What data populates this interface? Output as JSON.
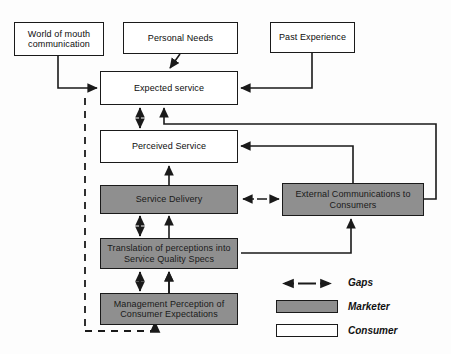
{
  "diagram": {
    "colors": {
      "marketer_fill": "#8f8f8f",
      "consumer_fill": "#ffffff",
      "stroke": "#1a1a1a",
      "background": "#fdfdfd"
    },
    "nodes": [
      {
        "id": "word_of_mouth",
        "label": "World of mouth communication",
        "type": "consumer"
      },
      {
        "id": "personal_needs",
        "label": "Personal Needs",
        "type": "consumer"
      },
      {
        "id": "past_experience",
        "label": "Past Experience",
        "type": "consumer"
      },
      {
        "id": "expected_service",
        "label": "Expected service",
        "type": "consumer"
      },
      {
        "id": "perceived_service",
        "label": "Perceived Service",
        "type": "consumer"
      },
      {
        "id": "service_delivery",
        "label": "Service Delivery",
        "type": "marketer"
      },
      {
        "id": "external_comm",
        "label": "External Communications to Consumers",
        "type": "marketer"
      },
      {
        "id": "translation",
        "label": "Translation of perceptions into Service Quality Specs",
        "type": "marketer"
      },
      {
        "id": "mgmt_perception",
        "label": "Management Perception of Consumer Expectations",
        "type": "marketer"
      }
    ],
    "legend": [
      {
        "key": "gaps-arrow",
        "label": "Gaps"
      },
      {
        "key": "marketer-swatch",
        "label": "Marketer"
      },
      {
        "key": "consumer-swatch",
        "label": "Consumer"
      }
    ]
  }
}
